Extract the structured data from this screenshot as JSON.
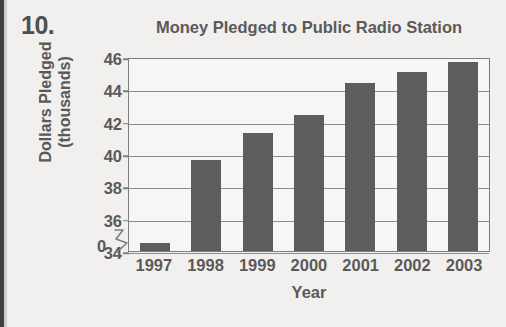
{
  "page": {
    "question_number": "10.",
    "background_color": "#f1f0ee",
    "edge_color": "#3d3f42"
  },
  "chart_data": {
    "type": "bar",
    "title": "Money Pledged to Public Radio Station",
    "xlabel": "Year",
    "ylabel": "Dollars Pledged (thousands)",
    "ylabel_line1": "Dollars Pledged",
    "ylabel_line2": "(thousands)",
    "categories": [
      "1997",
      "1998",
      "1999",
      "2000",
      "2001",
      "2002",
      "2003"
    ],
    "values": [
      34.5,
      39.6,
      41.3,
      42.4,
      44.4,
      45.1,
      45.7
    ],
    "ylim": [
      34,
      46
    ],
    "yticks": [
      "46",
      "44",
      "42",
      "40",
      "38",
      "36",
      "34"
    ],
    "ytick_values": [
      46,
      44,
      42,
      40,
      38,
      36,
      34
    ],
    "zero_tick": "0",
    "axis_break": true,
    "grid": true,
    "legend": null,
    "bar_color": "#5d5d5d",
    "grid_color": "#8d8d8d",
    "frame_color": "#7d7d7d",
    "plot_background": "#f7f6f4"
  }
}
